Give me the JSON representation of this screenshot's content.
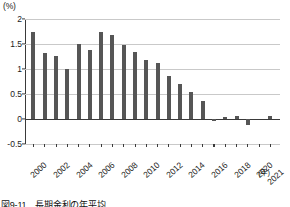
{
  "chart_data": {
    "type": "bar",
    "title": "図9-11　長期金利の年平均",
    "xlabel": "(年)",
    "ylabel": "(%)",
    "ylim": [
      -0.5,
      2
    ],
    "yticks": [
      "2",
      "1.5",
      "1",
      "0.5",
      "0",
      "-0.5"
    ],
    "ytick_values": [
      2,
      1.5,
      1,
      0.5,
      0,
      -0.5
    ],
    "grid": true,
    "legend": "none",
    "categories": [
      "2000",
      "2001",
      "2002",
      "2003",
      "2004",
      "2005",
      "2006",
      "2007",
      "2008",
      "2009",
      "2010",
      "2011",
      "2012",
      "2013",
      "2014",
      "2015",
      "2016",
      "2017",
      "2018",
      "2019",
      "2020",
      "2021"
    ],
    "tick_labels": [
      "2000",
      "",
      "2002",
      "",
      "2004",
      "",
      "2006",
      "",
      "2008",
      "",
      "2010",
      "",
      "2012",
      "",
      "2014",
      "",
      "2016",
      "",
      "2018",
      "",
      "2020",
      "2021"
    ],
    "values": [
      1.75,
      1.33,
      1.27,
      1.0,
      1.51,
      1.38,
      1.74,
      1.68,
      1.49,
      1.35,
      1.18,
      1.12,
      0.86,
      0.71,
      0.54,
      0.36,
      -0.04,
      0.05,
      0.07,
      -0.11,
      0.0,
      0.06
    ],
    "bar_color": "#565656",
    "axis_color": "#3a3a3a",
    "grid_color": "#c9c9c9"
  }
}
